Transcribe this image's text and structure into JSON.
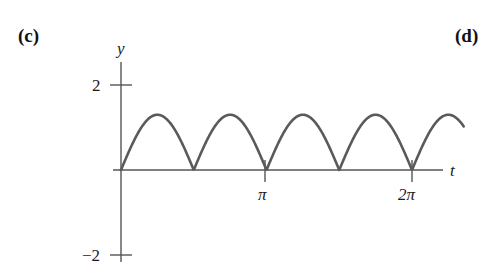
{
  "figure": {
    "part_label_c": "(c)",
    "part_label_d": "(d)"
  },
  "axes": {
    "y_label": "y",
    "x_label": "t",
    "y_ticks": [
      "2",
      "−2"
    ],
    "x_ticks": [
      "π",
      "2π"
    ],
    "axis_color": "#555555",
    "curve_color": "#5a5a5a"
  },
  "chart_data": {
    "type": "line",
    "title": "",
    "xlabel": "t",
    "ylabel": "y",
    "xlim": [
      0,
      7.4
    ],
    "ylim": [
      -2,
      2
    ],
    "grid": false,
    "legend": null,
    "xticks": [
      3.14159,
      6.28319
    ],
    "xticklabels": [
      "π",
      "2π"
    ],
    "yticks": [
      2,
      -2
    ],
    "yticklabels": [
      "2",
      "−2"
    ],
    "function": "y = 1.3 * |sin(2t)|",
    "amplitude": 1.3,
    "period": 1.5708,
    "zeros": [
      0,
      1.5708,
      3.14159,
      4.71239,
      6.28319
    ],
    "peaks_x": [
      0.7854,
      2.35619,
      3.92699,
      5.49779,
      7.06858
    ],
    "peaks_y": [
      1.3,
      1.3,
      1.3,
      1.3,
      1.3
    ],
    "x": [
      0,
      0.19635,
      0.3927,
      0.58905,
      0.7854,
      0.98175,
      1.1781,
      1.37445,
      1.5708,
      1.76715,
      1.9635,
      2.15984,
      2.35619,
      2.55254,
      2.74889,
      2.94524,
      3.14159,
      3.33794,
      3.53429,
      3.73064,
      3.92699,
      4.12334,
      4.31969,
      4.51604,
      4.71239,
      4.90874,
      5.10509,
      5.30144,
      5.49779,
      5.69414,
      5.89049,
      6.08684,
      6.28319,
      6.47953,
      6.67588,
      6.87223,
      7.06858,
      7.26493,
      7.4
    ],
    "y": [
      0,
      0.4976,
      0.9192,
      1.201,
      1.3,
      1.201,
      0.9192,
      0.4976,
      0,
      0.4976,
      0.9192,
      1.201,
      1.3,
      1.201,
      0.9192,
      0.4976,
      0,
      0.4976,
      0.9192,
      1.201,
      1.3,
      1.201,
      0.9192,
      0.4976,
      0,
      0.4976,
      0.9192,
      1.201,
      1.3,
      1.201,
      0.9192,
      0.4976,
      0,
      0.4976,
      0.9192,
      1.201,
      1.3,
      1.201,
      1.09
    ]
  }
}
